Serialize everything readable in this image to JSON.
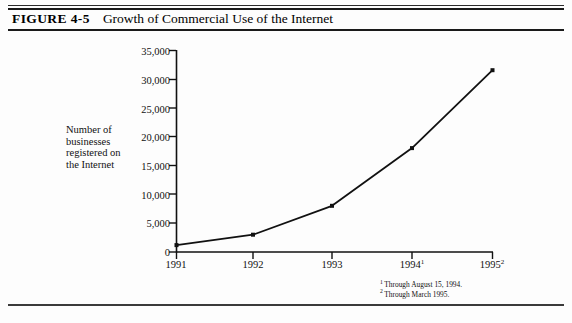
{
  "figure": {
    "number_label": "FIGURE 4-5",
    "title": "Growth of Commercial Use of the Internet"
  },
  "chart_data": {
    "type": "line",
    "title": "Growth of Commercial Use of the Internet",
    "xlabel": "",
    "ylabel": "Number of businesses registered on the Internet",
    "categories": [
      "1991",
      "1992",
      "1993",
      "1994",
      "1995"
    ],
    "x_tick_labels": [
      "1991",
      "1992",
      "1993",
      "1994",
      "1995"
    ],
    "x_tick_superscripts": [
      "",
      "",
      "",
      "1",
      "2"
    ],
    "values": [
      1200,
      3000,
      8000,
      18000,
      31500
    ],
    "series": [
      {
        "name": "Number of businesses registered on the Internet",
        "values": [
          1200,
          3000,
          8000,
          18000,
          31500
        ]
      }
    ],
    "ylim": [
      0,
      35000
    ],
    "y_ticks": [
      0,
      5000,
      10000,
      15000,
      20000,
      25000,
      30000,
      35000
    ],
    "y_tick_labels": [
      "0",
      "5,000",
      "10,000",
      "15,000",
      "20,000",
      "25,000",
      "30,000",
      "35,000"
    ],
    "grid": false,
    "legend": false,
    "marker": "square",
    "line_color": "#111111"
  },
  "y_axis_title_lines": [
    "Number of",
    "businesses",
    "registered on",
    "the Internet"
  ],
  "footnotes": [
    {
      "marker": "1",
      "text": "Through August 15, 1994."
    },
    {
      "marker": "2",
      "text": "Through March 1995."
    }
  ]
}
